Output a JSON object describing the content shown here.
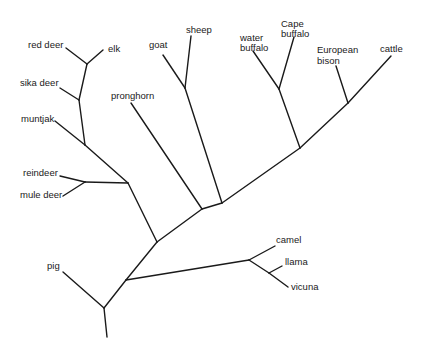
{
  "diagram": {
    "type": "phylogenetic-tree",
    "taxa": {
      "red_deer": "red deer",
      "elk": "elk",
      "sika_deer": "sika deer",
      "muntjak": "muntjak",
      "reindeer": "reindeer",
      "mule_deer": "mule deer",
      "pronghorn": "pronghorn",
      "goat": "goat",
      "sheep": "sheep",
      "water_buffalo_1": "water",
      "water_buffalo_2": "buffalo",
      "cape_buffalo_1": "Cape",
      "cape_buffalo_2": "buffalo",
      "european_bison_1": "European",
      "european_bison_2": "bison",
      "cattle": "cattle",
      "pig": "pig",
      "camel": "camel",
      "llama": "llama",
      "vicuna": "vicuna"
    },
    "clades": [
      {
        "name": "Cervidae",
        "members": [
          "red deer",
          "elk",
          "sika deer",
          "muntjak",
          "reindeer",
          "mule deer"
        ]
      },
      {
        "name": "Bovidae+Antilocapridae",
        "members": [
          "pronghorn",
          "goat",
          "sheep",
          "water buffalo",
          "Cape buffalo",
          "European bison",
          "cattle"
        ]
      },
      {
        "name": "Camelidae",
        "members": [
          "camel",
          "llama",
          "vicuna"
        ]
      },
      {
        "name": "Suidae",
        "members": [
          "pig"
        ]
      }
    ]
  }
}
